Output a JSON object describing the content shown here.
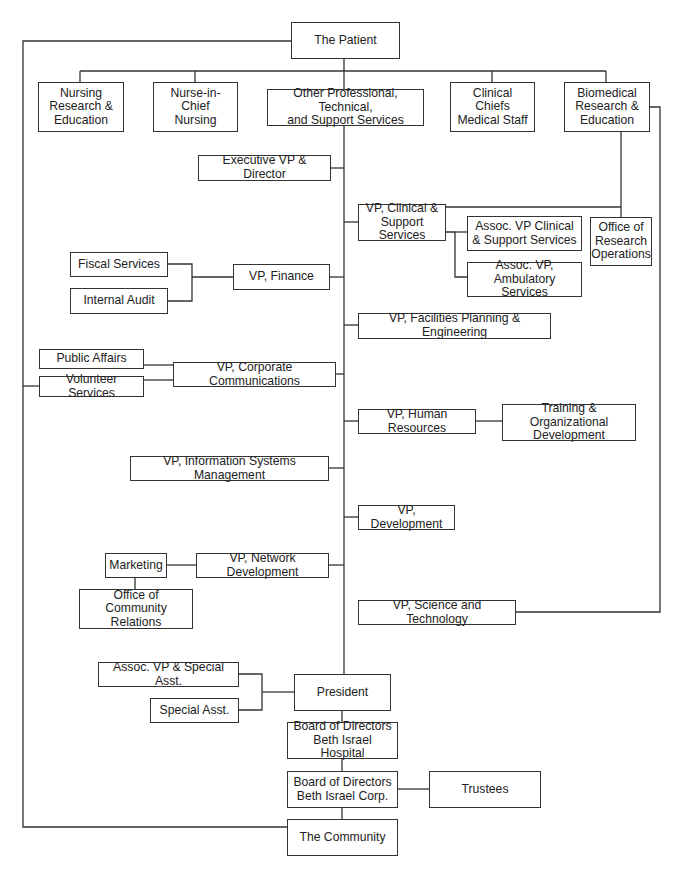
{
  "nodes": {
    "patient": "The Patient",
    "nursing_research": "Nursing\nResearch &\nEducation",
    "nurse_in_chief": "Nurse-in-Chief\nNursing",
    "other_prof": "Other Professional, Technical,\nand Support Services",
    "clinical_chiefs": "Clinical Chiefs\nMedical Staff",
    "biomedical": "Biomedical\nResearch &\nEducation",
    "exec_vp": "Executive VP & Director",
    "vp_clinical": "VP, Clinical &\nSupport Services",
    "assoc_vp_clinical": "Assoc. VP Clinical\n& Support Services",
    "assoc_vp_ambulatory": "Assoc. VP,\nAmbulatory Services",
    "office_research_ops": "Office of\nResearch\nOperations",
    "fiscal_services": "Fiscal Services",
    "internal_audit": "Internal Audit",
    "vp_finance": "VP, Finance",
    "vp_facilities": "VP, Facilities Planning & Engineering",
    "public_affairs": "Public Affairs",
    "volunteer_services": "Volunteer Services",
    "vp_corp_comm": "VP, Corporate Communications",
    "vp_hr": "VP, Human Resources",
    "training_org_dev": "Training & Organizational\nDevelopment",
    "vp_ism": "VP, Information Systems Management",
    "vp_development": "VP, Development",
    "marketing": "Marketing",
    "vp_network_dev": "VP, Network Development",
    "office_community_rel": "Office of\nCommunity Relations",
    "vp_science_tech": "VP, Science and Technology",
    "assoc_vp_special": "Assoc. VP & Special Asst.",
    "special_asst": "Special Asst.",
    "president": "President",
    "board_hospital": "Board of Directors\nBeth Israel Hospital",
    "board_corp": "Board of Directors\nBeth Israel Corp.",
    "trustees": "Trustees",
    "community": "The Community"
  },
  "colors": {
    "line": "#333333",
    "box_border": "#333333",
    "background": "#ffffff"
  }
}
